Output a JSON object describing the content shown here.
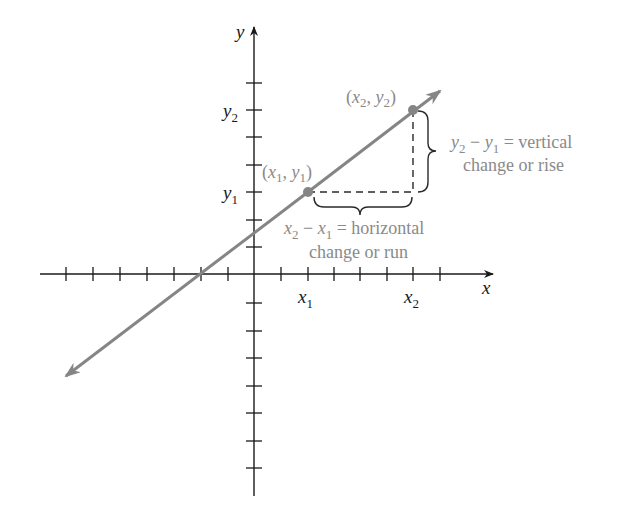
{
  "diagram": {
    "axes": {
      "x_label": "x",
      "y_label": "y"
    },
    "ticks": {
      "x_tick_labels": [
        {
          "base": "x",
          "sub": "1"
        },
        {
          "base": "x",
          "sub": "2"
        }
      ],
      "y_tick_labels": [
        {
          "base": "y",
          "sub": "1"
        },
        {
          "base": "y",
          "sub": "2"
        }
      ]
    },
    "points": [
      {
        "label_base1": "x",
        "sub1": "1",
        "label_base2": "y",
        "sub2": "1",
        "open": "(",
        "comma": ", ",
        "close": ")"
      },
      {
        "label_base1": "x",
        "sub1": "2",
        "label_base2": "y",
        "sub2": "2",
        "open": "(",
        "comma": ", ",
        "close": ")"
      }
    ],
    "annotations": {
      "vertical": {
        "lhs_a": "y",
        "lhs_a_sub": "2",
        "minus": " − ",
        "lhs_b": "y",
        "lhs_b_sub": "1",
        "eq": " = vertical",
        "line2": "change or rise"
      },
      "horizontal": {
        "lhs_a": "x",
        "lhs_a_sub": "2",
        "minus": " − ",
        "lhs_b": "x",
        "lhs_b_sub": "1",
        "eq": " = horizontal",
        "line2": "change or run"
      }
    },
    "colors": {
      "line": "#858585",
      "axis": "#1a1a1a",
      "annotation_text": "#8a8a8a"
    }
  }
}
